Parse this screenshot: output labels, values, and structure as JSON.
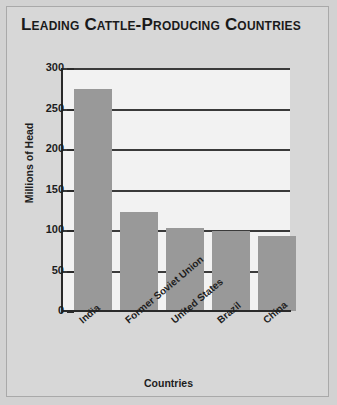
{
  "figure": {
    "title": "Leading Cattle-Producing Countries",
    "background_color": "#d7d7d7",
    "plot_background_color": "#f2f2f2",
    "bar_color": "#999999",
    "border_color": "#a9a9a9"
  },
  "chart_data": {
    "type": "bar",
    "title": "Leading Cattle-Producing Countries",
    "categories": [
      "India",
      "Former\nSoviet Union",
      "United States",
      "Brazil",
      "China"
    ],
    "category_labels": [
      "India",
      "Former Soviet Union",
      "United States",
      "Brazil",
      "China"
    ],
    "values": [
      274,
      122,
      102,
      99,
      92
    ],
    "xlabel": "Countries",
    "ylabel": "Millions of Head",
    "ylim": [
      0,
      300
    ],
    "yticks": [
      0,
      50,
      100,
      150,
      200,
      250,
      300
    ],
    "ytick_labels": [
      "0",
      "50",
      "100",
      "150",
      "200",
      "250",
      "300"
    ],
    "grid": true,
    "grid_axis": "y",
    "legend": false,
    "units": "millions of head"
  }
}
